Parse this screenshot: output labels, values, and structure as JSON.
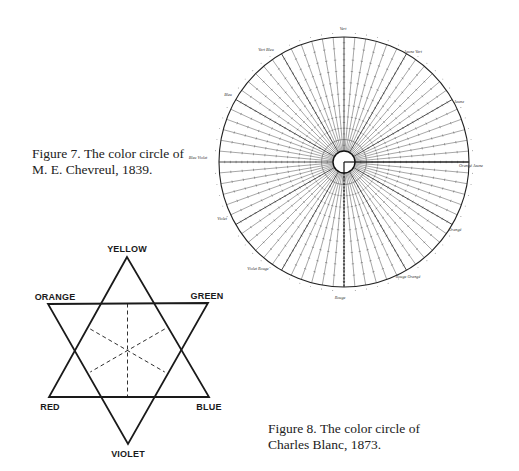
{
  "figure7": {
    "caption_line1": "Figure 7. The color circle of",
    "caption_line2": "M. E. Chevreul, 1839.",
    "wheel": {
      "cx": 344,
      "cy": 162,
      "r": 125,
      "inner_r": 11,
      "spoke_count": 72,
      "stroke": "#3a3a3a",
      "labels": [
        {
          "text": "Vert",
          "x": 343,
          "y": 30
        },
        {
          "text": "Vert Bleu",
          "x": 266,
          "y": 51
        },
        {
          "text": "Jaune Vert",
          "x": 413,
          "y": 53
        },
        {
          "text": "Bleu",
          "x": 228,
          "y": 96
        },
        {
          "text": "Jaune",
          "x": 459,
          "y": 103
        },
        {
          "text": "Bleu Violet",
          "x": 198,
          "y": 159
        },
        {
          "text": "Orangé Jaune",
          "x": 471,
          "y": 167
        },
        {
          "text": "Violet",
          "x": 222,
          "y": 220
        },
        {
          "text": "Orangé",
          "x": 455,
          "y": 231
        },
        {
          "text": "Violet Rouge",
          "x": 258,
          "y": 270
        },
        {
          "text": "Rouge Orangé",
          "x": 408,
          "y": 278
        },
        {
          "text": "Rouge",
          "x": 340,
          "y": 299
        }
      ]
    }
  },
  "figure8": {
    "caption_line1": "Figure 8. The color circle of",
    "caption_line2": "Charles Blanc, 1873.",
    "star": {
      "stroke": "#1a1a1a",
      "points": {
        "yellow": [
          127,
          257
        ],
        "orange": [
          48,
          304
        ],
        "green": [
          208,
          303
        ],
        "red": [
          49,
          397
        ],
        "blue": [
          209,
          397
        ],
        "violet": [
          128,
          444
        ]
      },
      "labels": [
        {
          "key": "yellow",
          "text": "YELLOW",
          "x": 127,
          "y": 252,
          "anchor": "middle"
        },
        {
          "key": "orange",
          "text": "ORANGE",
          "x": 55,
          "y": 300,
          "anchor": "middle"
        },
        {
          "key": "green",
          "text": "GREEN",
          "x": 207,
          "y": 299,
          "anchor": "middle"
        },
        {
          "key": "red",
          "text": "RED",
          "x": 50,
          "y": 410,
          "anchor": "middle"
        },
        {
          "key": "blue",
          "text": "BLUE",
          "x": 209,
          "y": 410,
          "anchor": "middle"
        },
        {
          "key": "violet",
          "text": "VIOLET",
          "x": 128,
          "y": 457,
          "anchor": "middle"
        }
      ]
    }
  }
}
